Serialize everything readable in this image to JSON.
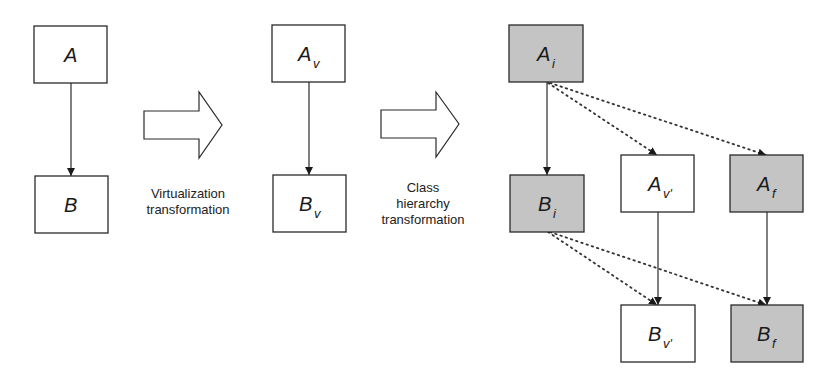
{
  "colors": {
    "stroke": "#2a2a2a",
    "shaded_fill": "#c4c4c4",
    "plain_fill": "#ffffff",
    "text": "#1a1a1a"
  },
  "stages": [
    {
      "name": "original",
      "boxes": [
        {
          "id": "A",
          "label": "A",
          "sub": "",
          "shaded": false
        },
        {
          "id": "B",
          "label": "B",
          "sub": "",
          "shaded": false
        }
      ]
    },
    {
      "name": "virtualized",
      "boxes": [
        {
          "id": "Av",
          "label": "A",
          "sub": "v",
          "shaded": false
        },
        {
          "id": "Bv",
          "label": "B",
          "sub": "v",
          "shaded": false
        }
      ]
    },
    {
      "name": "class-hierarchy",
      "boxes": [
        {
          "id": "Ai",
          "label": "A",
          "sub": "i",
          "shaded": true
        },
        {
          "id": "Bi",
          "label": "B",
          "sub": "i",
          "shaded": true
        },
        {
          "id": "Av2",
          "label": "A",
          "sub": "v'",
          "shaded": false
        },
        {
          "id": "Af",
          "label": "A",
          "sub": "f",
          "shaded": true
        },
        {
          "id": "Bv2",
          "label": "B",
          "sub": "v'",
          "shaded": false
        },
        {
          "id": "Bf",
          "label": "B",
          "sub": "f",
          "shaded": true
        }
      ]
    }
  ],
  "transformations": [
    {
      "lines": [
        "Virtualization",
        "transformation"
      ]
    },
    {
      "lines": [
        "Class",
        "hierarchy",
        "transformation"
      ]
    }
  ],
  "edges": {
    "solid": [
      [
        "A",
        "B"
      ],
      [
        "Av",
        "Bv"
      ],
      [
        "Ai",
        "Bi"
      ],
      [
        "Av2",
        "Bv2"
      ],
      [
        "Af",
        "Bf"
      ]
    ],
    "dotted": [
      [
        "Ai",
        "Av2"
      ],
      [
        "Ai",
        "Af"
      ],
      [
        "Bi",
        "Bv2"
      ],
      [
        "Bi",
        "Bf"
      ]
    ]
  }
}
